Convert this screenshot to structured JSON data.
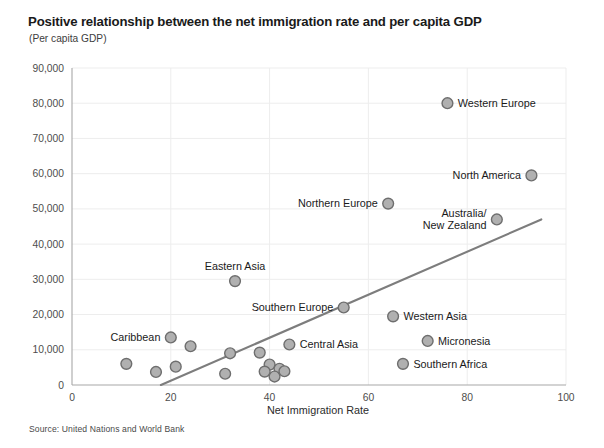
{
  "chart_data": {
    "type": "scatter",
    "title": "Positive relationship between the net immigration rate and per capita GDP",
    "subtitle": "(Per capita GDP)",
    "source": "Source: United Nations and World Bank",
    "xlabel": "Net Immigration Rate",
    "ylabel": "",
    "xlim": [
      0,
      100
    ],
    "ylim": [
      0,
      90000
    ],
    "xticks": [
      "0",
      "20",
      "40",
      "60",
      "80",
      "100"
    ],
    "xtick_values": [
      0,
      20,
      40,
      60,
      80,
      100
    ],
    "yticks": [
      "0",
      "10,000",
      "20,000",
      "30,000",
      "40,000",
      "50,000",
      "60,000",
      "70,000",
      "80,000",
      "90,000"
    ],
    "ytick_values": [
      0,
      10000,
      20000,
      30000,
      40000,
      50000,
      60000,
      70000,
      80000,
      90000
    ],
    "grid": true,
    "legend": "none",
    "marker_color": "#b0b0b0",
    "marker_edge_color": "#6e6e6e",
    "trendline_color": "#7d7d7d",
    "trendline": {
      "x": [
        18,
        95
      ],
      "y": [
        0,
        47000
      ]
    },
    "points": [
      {
        "label": "Western Europe",
        "x": 76,
        "y": 80000,
        "label_pos": "right"
      },
      {
        "label": "North America",
        "x": 93,
        "y": 59500,
        "label_pos": "left"
      },
      {
        "label": "Northern Europe",
        "x": 64,
        "y": 51500,
        "label_pos": "left"
      },
      {
        "label": "Australia/\nNew Zealand",
        "x": 86,
        "y": 47000,
        "label_pos": "left"
      },
      {
        "label": "Eastern Asia",
        "x": 33,
        "y": 29500,
        "label_pos": "top"
      },
      {
        "label": "Southern Europe",
        "x": 55,
        "y": 22000,
        "label_pos": "left"
      },
      {
        "label": "Western Asia",
        "x": 65,
        "y": 19500,
        "label_pos": "right"
      },
      {
        "label": "Micronesia",
        "x": 72,
        "y": 12500,
        "label_pos": "right"
      },
      {
        "label": "Caribbean",
        "x": 20,
        "y": 13500,
        "label_pos": "left"
      },
      {
        "label": "Central Asia",
        "x": 44,
        "y": 11500,
        "label_pos": "right"
      },
      {
        "label": "Southern Africa",
        "x": 67,
        "y": 6000,
        "label_pos": "right"
      },
      {
        "label": "",
        "x": 24,
        "y": 11000,
        "label_pos": "none"
      },
      {
        "label": "",
        "x": 32,
        "y": 9000,
        "label_pos": "none"
      },
      {
        "label": "",
        "x": 38,
        "y": 9200,
        "label_pos": "none"
      },
      {
        "label": "",
        "x": 11,
        "y": 6000,
        "label_pos": "none"
      },
      {
        "label": "",
        "x": 21,
        "y": 5200,
        "label_pos": "none"
      },
      {
        "label": "",
        "x": 17,
        "y": 3700,
        "label_pos": "none"
      },
      {
        "label": "",
        "x": 31,
        "y": 3200,
        "label_pos": "none"
      },
      {
        "label": "",
        "x": 40,
        "y": 5800,
        "label_pos": "none"
      },
      {
        "label": "",
        "x": 42,
        "y": 4600,
        "label_pos": "none"
      },
      {
        "label": "",
        "x": 39,
        "y": 3800,
        "label_pos": "none"
      },
      {
        "label": "",
        "x": 41,
        "y": 2400,
        "label_pos": "none"
      },
      {
        "label": "",
        "x": 43,
        "y": 3900,
        "label_pos": "none"
      }
    ]
  }
}
